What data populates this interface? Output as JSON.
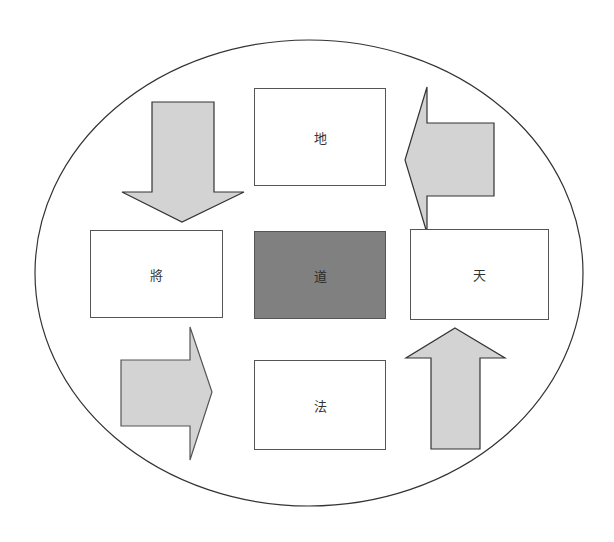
{
  "diagram": {
    "container": {
      "shape": "ellipse",
      "stroke": "#333333",
      "fill": "#ffffff"
    },
    "boxes": [
      {
        "id": "top",
        "label": "地"
      },
      {
        "id": "left",
        "label": "將"
      },
      {
        "id": "center",
        "label": "道"
      },
      {
        "id": "right",
        "label": "天"
      },
      {
        "id": "bottom",
        "label": "法"
      }
    ],
    "arrows": [
      {
        "id": "arrow-down",
        "direction": "down"
      },
      {
        "id": "arrow-left",
        "direction": "left"
      },
      {
        "id": "arrow-right",
        "direction": "right"
      },
      {
        "id": "arrow-up",
        "direction": "up"
      }
    ],
    "colors": {
      "arrow_fill": "#d3d3d3",
      "arrow_stroke": "#333333",
      "center_fill": "#808080",
      "box_fill": "#ffffff",
      "box_stroke": "#555555"
    }
  }
}
